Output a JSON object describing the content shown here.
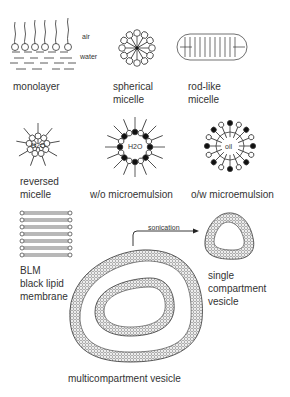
{
  "diagram": {
    "colors": {
      "ink": "#222222",
      "background": "#ffffff",
      "filled_head": "#111111"
    },
    "monolayer": {
      "label": "monolayer",
      "air_label": "air",
      "water_label": "water"
    },
    "spherical_micelle": {
      "label_line1": "spherical",
      "label_line2": "micelle"
    },
    "rod_like_micelle": {
      "label_line1": "rod-like",
      "label_line2": "micelle"
    },
    "reversed_micelle": {
      "label_line1": "reversed",
      "label_line2": "micelle",
      "core_label": "H2O"
    },
    "wo_microemulsion": {
      "label": "w/o microemulsion",
      "core_label": "H2O"
    },
    "ow_microemulsion": {
      "label": "o/w microemulsion",
      "core_label": "oil"
    },
    "blm": {
      "label_line1": "BLM",
      "label_line2": "black lipid",
      "label_line3": "membrane"
    },
    "sonication_arrow": {
      "label": "sonication"
    },
    "single_vesicle": {
      "label_line1": "single",
      "label_line2": "compartment",
      "label_line3": "vesicle"
    },
    "multi_vesicle": {
      "label": "multicompartment vesicle"
    }
  }
}
